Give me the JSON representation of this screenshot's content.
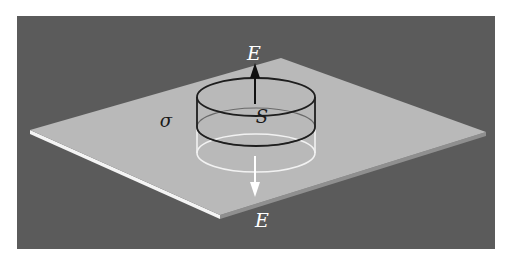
{
  "figure": {
    "colors": {
      "background": "#ffffff",
      "frame": "#5b5b5b",
      "plate_top": "#b9b9b9",
      "plate_front_edge": "#f4f4f4",
      "plate_right_edge": "#8f8f8f",
      "cylinder_upper": "#1e1e1e",
      "cylinder_lower": "#f2f2f2",
      "arrow_up": "#111111",
      "arrow_down": "#ffffff",
      "label_dark": "#1a1a1a",
      "label_light": "#ffffff"
    },
    "labels": {
      "field_up": "E",
      "field_down": "E",
      "charge_density": "σ",
      "surface": "S"
    }
  }
}
